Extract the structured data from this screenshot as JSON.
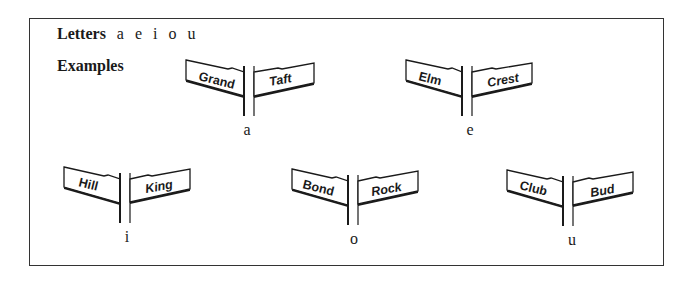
{
  "heading": {
    "label": "Letters",
    "letters": [
      "a",
      "e",
      "i",
      "o",
      "u"
    ]
  },
  "examples_label": "Examples",
  "examples": [
    {
      "vowel": "a",
      "left_sign": "Grand",
      "right_sign": "Taft"
    },
    {
      "vowel": "e",
      "left_sign": "Elm",
      "right_sign": "Crest"
    },
    {
      "vowel": "i",
      "left_sign": "Hill",
      "right_sign": "King"
    },
    {
      "vowel": "o",
      "left_sign": "Bond",
      "right_sign": "Rock"
    },
    {
      "vowel": "u",
      "left_sign": "Club",
      "right_sign": "Bud"
    }
  ],
  "colors": {
    "ink": "#1a1a1a",
    "frame": "#333333",
    "background": "#ffffff"
  }
}
